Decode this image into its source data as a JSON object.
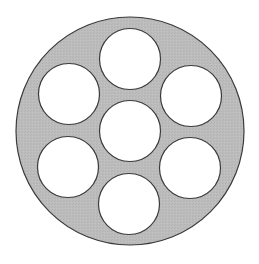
{
  "diagram": {
    "canvas": {
      "width": 259,
      "height": 264,
      "background": "#ffffff"
    },
    "outer_disc": {
      "cx": 130,
      "cy": 131,
      "r": 114,
      "fill": "#b9b9b9",
      "stroke": "#3a3a3a",
      "stroke_width": 1.2
    },
    "holes": [
      {
        "name": "hole-top",
        "cx": 130,
        "cy": 59,
        "r": 30.5
      },
      {
        "name": "hole-upper-left",
        "cx": 69,
        "cy": 94,
        "r": 30.5
      },
      {
        "name": "hole-upper-right",
        "cx": 191,
        "cy": 96,
        "r": 30.5
      },
      {
        "name": "hole-center",
        "cx": 130,
        "cy": 131,
        "r": 30.5
      },
      {
        "name": "hole-lower-left",
        "cx": 68,
        "cy": 167,
        "r": 30.5
      },
      {
        "name": "hole-lower-right",
        "cx": 190,
        "cy": 168,
        "r": 30.5
      },
      {
        "name": "hole-bottom",
        "cx": 129,
        "cy": 204,
        "r": 30.5
      }
    ],
    "hole_style": {
      "fill": "#ffffff",
      "stroke": "#3a3a3a",
      "stroke_width": 1.2
    }
  }
}
